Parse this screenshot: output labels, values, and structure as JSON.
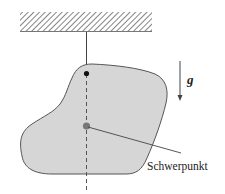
{
  "diagram": {
    "type": "physics-pendulum-center-of-mass",
    "labels": {
      "gravity": "g",
      "center_of_mass": "Schwerpunkt"
    },
    "colors": {
      "body_fill": "#d6d6d6",
      "body_stroke": "#555555",
      "ceiling_hatch": "#777777",
      "pivot": "#111111",
      "center_of_mass": "#777777",
      "lines": "#444444"
    },
    "icons": {
      "ceiling": "hatched-ceiling-icon",
      "gravity_arrow": "arrow-down-icon"
    }
  }
}
